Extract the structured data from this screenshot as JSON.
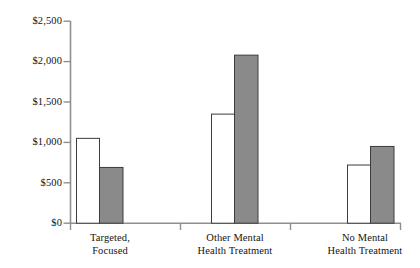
{
  "chart_data": {
    "type": "bar",
    "title": "",
    "subtitle": "",
    "xlabel": "",
    "ylabel": "",
    "categories": [
      "Targeted, Focused",
      "Other Mental Health Treatment",
      "No Mental Health Treatment"
    ],
    "category_lines": [
      [
        "Targeted,",
        "Focused"
      ],
      [
        "Other Mental",
        "Health Treatment"
      ],
      [
        "No Mental",
        "Health Treatment"
      ]
    ],
    "series": [
      {
        "name": "Series 1",
        "color": "#ffffff",
        "values": [
          1050,
          1350,
          720
        ]
      },
      {
        "name": "Series 2",
        "color": "#8a8a8a",
        "values": [
          690,
          2080,
          950
        ]
      }
    ],
    "ylim": [
      0,
      2500
    ],
    "ytick_values": [
      0,
      500,
      1000,
      1500,
      2000,
      2500
    ],
    "ytick_labels": [
      "$0",
      "$500",
      "$1,000",
      "$1,500",
      "$2,000",
      "$2,500"
    ],
    "grid": false,
    "legend": "none",
    "bar_outline_color": "#3c3c3c",
    "axis_color": "#8f8f8f"
  }
}
